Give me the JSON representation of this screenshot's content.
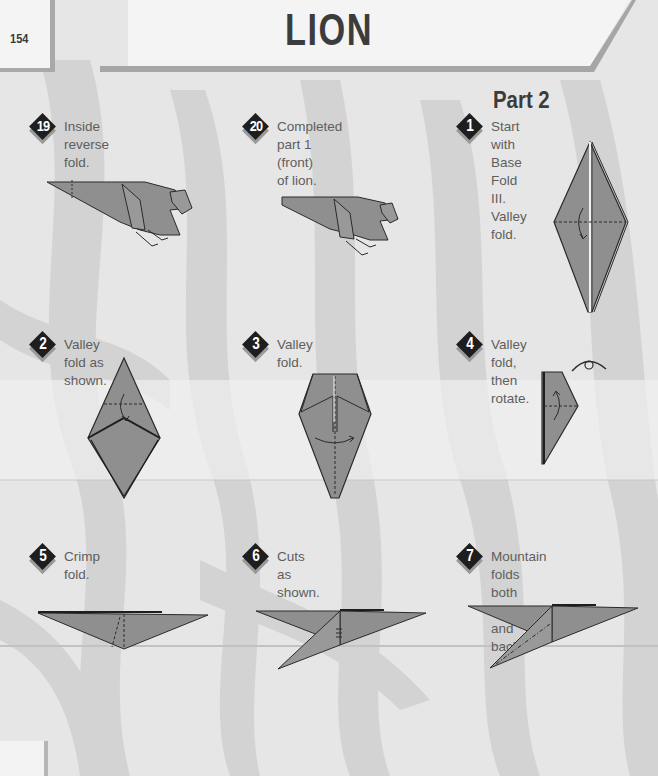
{
  "page": {
    "number": "154",
    "title": "LION",
    "section_heading": "Part 2"
  },
  "colors": {
    "paper_fill": "#8f8f8f",
    "outline": "#2a2a2a",
    "badge": "#1e1e1e",
    "background": "#e4e4e4"
  },
  "steps": [
    {
      "number": "19",
      "text": "Inside reverse fold.",
      "diagram": "lion-front-with-reverse-fold-line"
    },
    {
      "number": "20",
      "text": "Completed part 1 (front)\nof lion.",
      "diagram": "lion-front-completed"
    },
    {
      "number": "1",
      "text": "Start with Base Fold III.\nValley fold.",
      "diagram": "diamond-base-valley-fold"
    },
    {
      "number": "2",
      "text": "Valley fold as shown.",
      "diagram": "diamond-top-valley-fold"
    },
    {
      "number": "3",
      "text": "Valley fold.",
      "diagram": "kite-center-valley-fold"
    },
    {
      "number": "4",
      "text": "Valley fold, then rotate.",
      "diagram": "half-kite-valley-fold-rotate"
    },
    {
      "number": "5",
      "text": "Crimp fold.",
      "diagram": "flat-triangle-crimp"
    },
    {
      "number": "6",
      "text": "Cuts as shown.",
      "diagram": "crimped-shape-cuts"
    },
    {
      "number": "7",
      "text": "Mountain folds both front\nand back.",
      "diagram": "crimped-shape-mountain-folds"
    }
  ]
}
